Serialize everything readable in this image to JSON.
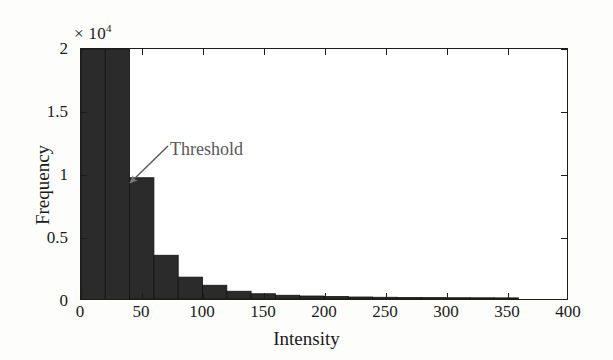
{
  "chart_data": {
    "type": "bar",
    "title": "",
    "subtitle": "",
    "xlabel": "Intensity",
    "ylabel": "Frequency",
    "y_multiplier_text": "× 10",
    "y_multiplier_exponent": "4",
    "y_multiplier_value": 10000,
    "xlim": [
      0,
      400
    ],
    "ylim": [
      0,
      20000
    ],
    "xticks": [
      0,
      50,
      100,
      150,
      200,
      250,
      300,
      350,
      400
    ],
    "xtick_labels": [
      "0",
      "50",
      "100",
      "150",
      "200",
      "250",
      "300",
      "350",
      "400"
    ],
    "yticks": [
      0,
      5000,
      10000,
      15000,
      20000
    ],
    "ytick_labels": [
      "0",
      "0.5",
      "1",
      "1.5",
      "2"
    ],
    "grid": false,
    "legend": false,
    "bin_width": 20,
    "bar_color": "#2b2b2b",
    "bar_edge_color": "#111111",
    "note": "first two bins are clipped at the top of the y-axis (values exceed 2e4)",
    "bins": [
      {
        "x0": 0,
        "x1": 20,
        "value": 20000,
        "clipped": true
      },
      {
        "x0": 20,
        "x1": 40,
        "value": 20000,
        "clipped": true
      },
      {
        "x0": 40,
        "x1": 60,
        "value": 9700,
        "clipped": false
      },
      {
        "x0": 60,
        "x1": 80,
        "value": 3500,
        "clipped": false
      },
      {
        "x0": 80,
        "x1": 100,
        "value": 1750,
        "clipped": false
      },
      {
        "x0": 100,
        "x1": 120,
        "value": 1100,
        "clipped": false
      },
      {
        "x0": 120,
        "x1": 140,
        "value": 620,
        "clipped": false
      },
      {
        "x0": 140,
        "x1": 160,
        "value": 420,
        "clipped": false
      },
      {
        "x0": 160,
        "x1": 180,
        "value": 300,
        "clipped": false
      },
      {
        "x0": 180,
        "x1": 200,
        "value": 240,
        "clipped": false
      },
      {
        "x0": 200,
        "x1": 220,
        "value": 200,
        "clipped": false
      },
      {
        "x0": 220,
        "x1": 240,
        "value": 160,
        "clipped": false
      },
      {
        "x0": 240,
        "x1": 260,
        "value": 140,
        "clipped": false
      },
      {
        "x0": 260,
        "x1": 280,
        "value": 120,
        "clipped": false
      },
      {
        "x0": 280,
        "x1": 300,
        "value": 110,
        "clipped": false
      },
      {
        "x0": 300,
        "x1": 320,
        "value": 100,
        "clipped": false
      },
      {
        "x0": 320,
        "x1": 340,
        "value": 95,
        "clipped": false
      },
      {
        "x0": 340,
        "x1": 360,
        "value": 90,
        "clipped": false
      }
    ],
    "annotations": [
      {
        "text": "Threshold",
        "color": "#57575a",
        "label_x": 170,
        "label_y": 139,
        "arrow_from_x": 168,
        "arrow_from_y": 146,
        "arrow_to_x": 130,
        "arrow_to_y": 183
      }
    ]
  },
  "axes": {
    "y_multiplier_label": "× 10",
    "y_multiplier_sup": "4",
    "x_title": "Intensity",
    "y_title": "Frequency"
  }
}
